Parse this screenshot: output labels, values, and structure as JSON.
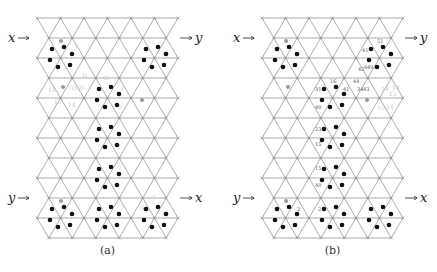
{
  "figure": {
    "panels": [
      {
        "id": "a",
        "caption": "(a)",
        "origin_x": 37,
        "input_top_label": "x",
        "output_top_label": "y",
        "input_bottom_label": "y",
        "output_bottom_label": "x",
        "clusters": [
          {
            "cx": 61,
            "cy": 57,
            "gray": true
          },
          {
            "cx": 155,
            "cy": 57,
            "gray": false
          },
          {
            "cx": 108,
            "cy": 97,
            "gray": false
          },
          {
            "cx": 108,
            "cy": 137,
            "gray": false
          },
          {
            "cx": 108,
            "cy": 177,
            "gray": false
          },
          {
            "cx": 61,
            "cy": 217,
            "gray": true
          },
          {
            "cx": 108,
            "cy": 217,
            "gray": false
          },
          {
            "cx": 155,
            "cy": 217,
            "gray": false
          }
        ],
        "extra_gray_dots": [
          {
            "x": 63,
            "y": 87
          },
          {
            "x": 142,
            "y": 100
          }
        ],
        "ghost_labels": [
          {
            "x": 74,
            "y": 50,
            "t": "7"
          },
          {
            "x": 82,
            "y": 78,
            "t": "Π"
          },
          {
            "x": 68,
            "y": 90,
            "t": "7Π Π"
          },
          {
            "x": 48,
            "y": 92,
            "t": "11"
          },
          {
            "x": 54,
            "y": 104,
            "t": "10"
          },
          {
            "x": 68,
            "y": 107,
            "t": "14"
          },
          {
            "x": 104,
            "y": 80,
            "t": "Π"
          },
          {
            "x": 120,
            "y": 92,
            "t": "7"
          },
          {
            "x": 118,
            "y": 110,
            "t": "7"
          },
          {
            "x": 117,
            "y": 150,
            "t": "7"
          },
          {
            "x": 118,
            "y": 170,
            "t": "7"
          },
          {
            "x": 120,
            "y": 210,
            "t": "7"
          },
          {
            "x": 138,
            "y": 210,
            "t": "7Π"
          },
          {
            "x": 152,
            "y": 200,
            "t": "7"
          }
        ]
      },
      {
        "id": "b",
        "caption": "(b)",
        "origin_x": 262,
        "input_top_label": "x",
        "output_top_label": "y",
        "input_bottom_label": "y",
        "output_bottom_label": "x",
        "clusters": [
          {
            "cx": 286,
            "cy": 57,
            "gray": true
          },
          {
            "cx": 380,
            "cy": 57,
            "gray": false
          },
          {
            "cx": 333,
            "cy": 97,
            "gray": false
          },
          {
            "cx": 333,
            "cy": 137,
            "gray": false
          },
          {
            "cx": 333,
            "cy": 177,
            "gray": false
          },
          {
            "cx": 286,
            "cy": 217,
            "gray": true
          },
          {
            "cx": 333,
            "cy": 217,
            "gray": false
          },
          {
            "cx": 380,
            "cy": 217,
            "gray": false
          }
        ],
        "extra_gray_dots": [
          {
            "x": 288,
            "y": 87
          },
          {
            "x": 367,
            "y": 100
          }
        ],
        "index_labels": [
          {
            "x": 377,
            "y": 43,
            "t": "51"
          },
          {
            "x": 362,
            "y": 52,
            "t": "41"
          },
          {
            "x": 358,
            "y": 71,
            "t": "42"
          },
          {
            "x": 364,
            "y": 69,
            "t": "4"
          },
          {
            "x": 367,
            "y": 69,
            "t": "40"
          },
          {
            "x": 330,
            "y": 83,
            "t": "16"
          },
          {
            "x": 353,
            "y": 83,
            "t": "44"
          },
          {
            "x": 315,
            "y": 91,
            "t": "31"
          },
          {
            "x": 343,
            "y": 91,
            "t": "41"
          },
          {
            "x": 357,
            "y": 91,
            "t": "34"
          },
          {
            "x": 363,
            "y": 91,
            "t": "43"
          },
          {
            "x": 315,
            "y": 109,
            "t": "40"
          },
          {
            "x": 315,
            "y": 131,
            "t": "23"
          },
          {
            "x": 315,
            "y": 146,
            "t": "15"
          },
          {
            "x": 315,
            "y": 170,
            "t": "15"
          },
          {
            "x": 315,
            "y": 187,
            "t": "40"
          },
          {
            "x": 297,
            "y": 211,
            "t": "2"
          },
          {
            "x": 318,
            "y": 211,
            "t": "2"
          }
        ],
        "ghost_labels": [
          {
            "x": 381,
            "y": 91,
            "t": "14"
          },
          {
            "x": 392,
            "y": 90,
            "t": "14"
          },
          {
            "x": 389,
            "y": 96,
            "t": "15"
          },
          {
            "x": 377,
            "y": 110,
            "t": "15"
          },
          {
            "x": 386,
            "y": 109,
            "t": "14"
          }
        ]
      }
    ],
    "grid": {
      "top_y": 18,
      "row_spacing": 20,
      "rows": 12,
      "col_spacing": 23.5,
      "cols": 6,
      "line_color": "#8a8a8a",
      "dot_color": "#111111",
      "gray_dot_color": "#999999"
    }
  }
}
